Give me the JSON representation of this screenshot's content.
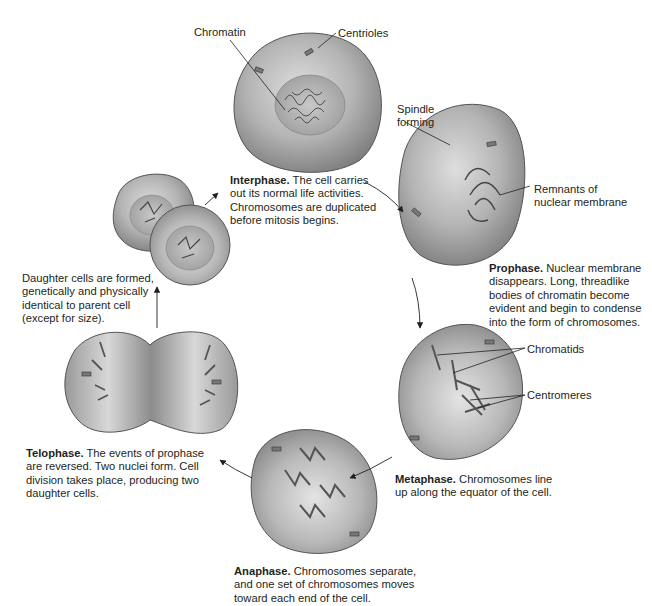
{
  "diagram": {
    "stages": [
      {
        "name": "Interphase.",
        "desc": "The cell carries",
        "lines": [
          "out its normal life activities.",
          "Chromosomes are duplicated",
          "before mitosis begins."
        ]
      },
      {
        "name": "Prophase.",
        "desc": "Nuclear membrane",
        "lines": [
          "disappears. Long, threadlike",
          "bodies of chromatin become",
          "evident and begin to condense",
          "into the form of chromosomes."
        ]
      },
      {
        "name": "Metaphase.",
        "desc": "Chromosomes line",
        "lines": [
          "up along the equator of the cell."
        ]
      },
      {
        "name": "Anaphase.",
        "desc": "Chromosomes separate,",
        "lines": [
          "and one set of chromosomes moves",
          "toward each end of the cell."
        ]
      },
      {
        "name": "Telophase.",
        "desc": "The events of prophase",
        "lines": [
          "are reversed. Two nuclei form. Cell",
          "division takes place, producing two",
          "daughter cells."
        ]
      }
    ],
    "daughter": {
      "lines": [
        "Daughter cells are formed,",
        "genetically and physically",
        "identical to parent cell",
        "(except for size)."
      ]
    },
    "labels": {
      "chromatin": "Chromatin",
      "centrioles": "Centrioles",
      "spindle_1": "Spindle",
      "spindle_2": "forming",
      "remnants_1": "Remnants of",
      "remnants_2": "nuclear membrane",
      "chromatids": "Chromatids",
      "centromeres": "Centromeres"
    },
    "colors": {
      "cell_fill": "#a8a8a8",
      "cell_light": "#d8d8d8",
      "outline": "#555555",
      "text": "#231f20"
    }
  }
}
